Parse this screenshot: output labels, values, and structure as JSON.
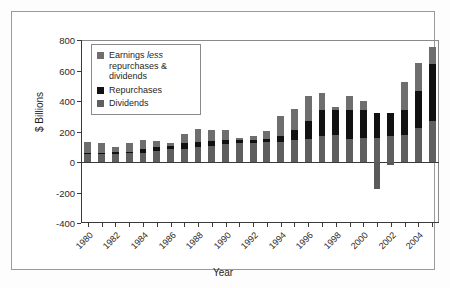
{
  "chart_data": {
    "type": "bar",
    "subtype": "stacked-bar-with-negatives",
    "title": "",
    "xlabel": "Year",
    "ylabel": "$ Billions",
    "ylim": [
      -400,
      800
    ],
    "yticks": [
      800,
      600,
      400,
      200,
      0,
      -200,
      -400
    ],
    "ytick_labels": [
      "800",
      "600",
      "400",
      "200",
      "0",
      "-200",
      "-400"
    ],
    "grid": false,
    "legend_position": "top-left-inside",
    "x": [
      1980,
      1981,
      1982,
      1983,
      1984,
      1985,
      1986,
      1987,
      1988,
      1989,
      1990,
      1991,
      1992,
      1993,
      1994,
      1995,
      1996,
      1997,
      1998,
      1999,
      2000,
      2001,
      2002,
      2003,
      2004,
      2005
    ],
    "xtick_labels": [
      "1980",
      "",
      "1982",
      "",
      "1984",
      "",
      "1986",
      "",
      "1988",
      "",
      "1990",
      "",
      "1992",
      "",
      "1994",
      "",
      "1996",
      "",
      "1998",
      "",
      "2000",
      "",
      "2002",
      "",
      "2004",
      ""
    ],
    "series": [
      {
        "name": "Dividends",
        "color": "#5f5f5f",
        "values": [
          50,
          52,
          54,
          58,
          62,
          72,
          82,
          88,
          98,
          106,
          118,
          122,
          124,
          128,
          134,
          146,
          154,
          170,
          178,
          152,
          158,
          158,
          172,
          180,
          222,
          272
        ]
      },
      {
        "name": "Repurchases",
        "color": "#111111",
        "values": [
          8,
          10,
          10,
          10,
          22,
          24,
          26,
          36,
          34,
          30,
          28,
          24,
          22,
          22,
          38,
          62,
          116,
          168,
          162,
          186,
          182,
          162,
          152,
          164,
          242,
          368
        ]
      },
      {
        "name": "Earnings less repurchases & dividends",
        "color": "#6e6e6e",
        "values": [
          72,
          64,
          32,
          58,
          62,
          42,
          14,
          58,
          84,
          74,
          62,
          14,
          22,
          54,
          128,
          142,
          162,
          114,
          18,
          94,
          62,
          -178,
          -22,
          178,
          186,
          114
        ]
      }
    ],
    "notes": {
      "negative_bars": [
        {
          "year": 2001,
          "value": -178
        },
        {
          "year": 2002,
          "value": -22
        }
      ],
      "max_total": 752,
      "max_total_year": 2005
    }
  },
  "legend": {
    "items": [
      {
        "swatch_color": "#6e6e6e",
        "label_html": "Earnings <em>less</em> repurchases &amp; dividends",
        "label_plain": "Earnings less repurchases & dividends",
        "name": "earnings-less-repurchases-dividends"
      },
      {
        "swatch_color": "#111111",
        "label_html": "Repurchases",
        "label_plain": "Repurchases",
        "name": "repurchases"
      },
      {
        "swatch_color": "#5f5f5f",
        "label_html": "Dividends",
        "label_plain": "Dividends",
        "name": "dividends"
      }
    ]
  },
  "colors": {
    "dividends": "#5f5f5f",
    "repurchases": "#111111",
    "earnings": "#6e6e6e",
    "axis": "#3a3a3a",
    "frame": "#9a9a9a",
    "background": "#ffffff"
  }
}
